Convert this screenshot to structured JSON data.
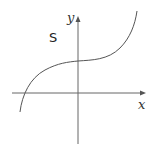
{
  "diagram": {
    "title": "",
    "curve_label": "S",
    "x_axis_label": "x",
    "y_axis_label": "y",
    "curve_description": "cubic-shaped curve with inflection point on the positive y-axis, increasing everywhere, crossing the negative x-axis",
    "colors": {
      "axis": "#555555",
      "curve": "#555555",
      "text": "#222222"
    }
  }
}
